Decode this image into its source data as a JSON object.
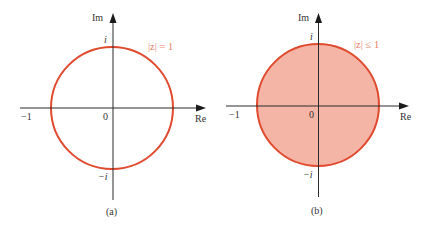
{
  "colors": {
    "circle_stroke": "#e04a2e",
    "disk_fill": "#f4b5a6",
    "equation_text": "#e8826a",
    "axis": "#2a2a2a"
  },
  "panels": [
    {
      "id": "a",
      "caption": "(a)",
      "equation": "|z| = 1",
      "region": "circle",
      "filled": false,
      "radius": 1,
      "labels": {
        "imag_axis": "Im",
        "real_axis": "Re",
        "origin": "0",
        "neg_one": "−1",
        "pos_i": "i",
        "neg_i": "−i"
      }
    },
    {
      "id": "b",
      "caption": "(b)",
      "equation": "|z| ≤ 1",
      "region": "disk",
      "filled": true,
      "radius": 1,
      "labels": {
        "imag_axis": "Im",
        "real_axis": "Re",
        "origin": "0",
        "neg_one": "−1",
        "pos_i": "i",
        "neg_i": "−i"
      }
    }
  ]
}
